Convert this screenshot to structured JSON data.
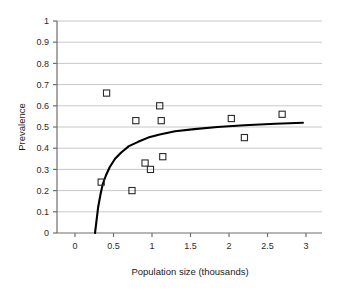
{
  "chart_data": {
    "type": "scatter",
    "title": "",
    "xlabel": "Population size (thousands)",
    "ylabel": "Prevalence",
    "xlim": [
      -0.25,
      3.2
    ],
    "ylim": [
      0,
      1
    ],
    "grid": true,
    "legend": false,
    "xticks": [
      0,
      0.5,
      1,
      1.5,
      2,
      2.5,
      3
    ],
    "xticklabels": [
      "0",
      "0.5",
      "1",
      "1.5",
      "2",
      "2.5",
      "3"
    ],
    "yticks": [
      0,
      0.1,
      0.2,
      0.3,
      0.4,
      0.5,
      0.6,
      0.7,
      0.8,
      0.9,
      1
    ],
    "yticklabels": [
      "0",
      "0.1",
      "0.2",
      "0.3",
      "0.4",
      "0.5",
      "0.6",
      "0.7",
      "0.8",
      "0.9",
      "1"
    ],
    "marker": "open-square",
    "marker_color": "#2b2b2b",
    "grid_color": "#c8c8c8",
    "axis_color": "#6e6e6e",
    "curve_color": "#000000",
    "series": [
      {
        "name": "Observations",
        "type": "scatter",
        "points": [
          {
            "x": 0.34,
            "y": 0.24
          },
          {
            "x": 0.41,
            "y": 0.66
          },
          {
            "x": 0.74,
            "y": 0.2
          },
          {
            "x": 0.79,
            "y": 0.53
          },
          {
            "x": 0.91,
            "y": 0.33
          },
          {
            "x": 0.98,
            "y": 0.3
          },
          {
            "x": 1.1,
            "y": 0.6
          },
          {
            "x": 1.12,
            "y": 0.53
          },
          {
            "x": 1.14,
            "y": 0.36
          },
          {
            "x": 2.03,
            "y": 0.54
          },
          {
            "x": 2.2,
            "y": 0.45
          },
          {
            "x": 2.69,
            "y": 0.56
          }
        ]
      },
      {
        "name": "Fitted curve",
        "type": "line",
        "points": [
          {
            "x": 0.26,
            "y": 0.0
          },
          {
            "x": 0.28,
            "y": 0.06
          },
          {
            "x": 0.3,
            "y": 0.12
          },
          {
            "x": 0.33,
            "y": 0.18
          },
          {
            "x": 0.36,
            "y": 0.23
          },
          {
            "x": 0.4,
            "y": 0.27
          },
          {
            "x": 0.45,
            "y": 0.31
          },
          {
            "x": 0.52,
            "y": 0.35
          },
          {
            "x": 0.6,
            "y": 0.38
          },
          {
            "x": 0.7,
            "y": 0.41
          },
          {
            "x": 0.82,
            "y": 0.43
          },
          {
            "x": 0.95,
            "y": 0.45
          },
          {
            "x": 1.1,
            "y": 0.465
          },
          {
            "x": 1.3,
            "y": 0.48
          },
          {
            "x": 1.55,
            "y": 0.49
          },
          {
            "x": 1.85,
            "y": 0.5
          },
          {
            "x": 2.2,
            "y": 0.508
          },
          {
            "x": 2.6,
            "y": 0.515
          },
          {
            "x": 2.96,
            "y": 0.52
          }
        ]
      }
    ]
  }
}
